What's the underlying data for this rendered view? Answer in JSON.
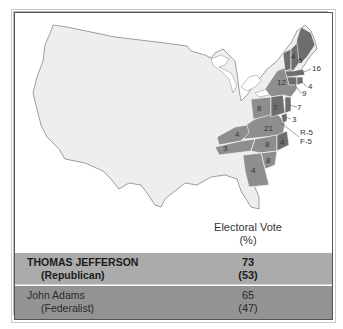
{
  "map": {
    "title_region": "United States electoral map, election of 1800",
    "states": [
      {
        "name": "New Hampshire",
        "votes": "6",
        "winner": "Federalist"
      },
      {
        "name": "Vermont",
        "votes": "4",
        "winner": "Federalist"
      },
      {
        "name": "Massachusetts",
        "votes": "16",
        "winner": "Federalist"
      },
      {
        "name": "Rhode Island",
        "votes": "4",
        "winner": "Federalist"
      },
      {
        "name": "Connecticut",
        "votes": "9",
        "winner": "Federalist"
      },
      {
        "name": "New York",
        "votes": "12",
        "winner": "Republican"
      },
      {
        "name": "New Jersey",
        "votes": "7",
        "winner": "Federalist"
      },
      {
        "name": "Pennsylvania",
        "votes": "8",
        "winner": "Republican"
      },
      {
        "name": "Pennsylvania-east",
        "votes": "7",
        "winner": "Federalist"
      },
      {
        "name": "Delaware",
        "votes": "3",
        "winner": "Federalist"
      },
      {
        "name": "Maryland",
        "votes": "R-5 / F-5",
        "winner": "Split"
      },
      {
        "name": "Virginia",
        "votes": "21",
        "winner": "Republican"
      },
      {
        "name": "North Carolina-west",
        "votes": "8",
        "winner": "Republican"
      },
      {
        "name": "North Carolina-east",
        "votes": "4",
        "winner": "Federalist"
      },
      {
        "name": "Kentucky",
        "votes": "4",
        "winner": "Republican"
      },
      {
        "name": "Tennessee",
        "votes": "3",
        "winner": "Republican"
      },
      {
        "name": "South Carolina",
        "votes": "8",
        "winner": "Republican"
      },
      {
        "name": "Georgia",
        "votes": "4",
        "winner": "Republican"
      }
    ],
    "labels": {
      "nh": "6",
      "vt": "4",
      "ma": "16",
      "ri": "4",
      "ct": "9",
      "ny": "12",
      "nj": "7",
      "pa": "8",
      "pa2": "7",
      "de": "3",
      "md_r": "R-5",
      "md_f": "F-5",
      "va": "21",
      "nc": "8",
      "nc2": "4",
      "ky": "4",
      "tn": "3",
      "sc": "8",
      "ga": "4"
    },
    "colors": {
      "republican": "#8e8e8e",
      "federalist": "#6e6e6e",
      "land": "#eeeeee",
      "border": "#ffffff"
    }
  },
  "table": {
    "header_line1": "Electoral Vote",
    "header_line2": "(%)",
    "rows": [
      {
        "name": "THOMAS JEFFERSON",
        "party": "(Republican)",
        "votes": "73",
        "percent": "(53)"
      },
      {
        "name": "John Adams",
        "party": "(Federalist)",
        "votes": "65",
        "percent": "(47)"
      }
    ]
  }
}
